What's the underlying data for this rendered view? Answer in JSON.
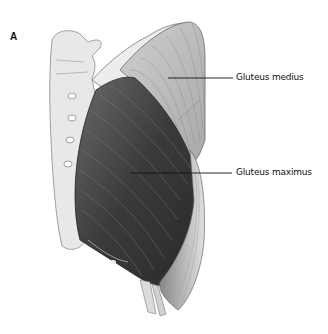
{
  "figure": {
    "panel_letter": "A",
    "labels": [
      {
        "text": "Gluteus medius",
        "leader": {
          "x1": 168,
          "y1": 78,
          "x2": 233,
          "y2": 78
        }
      },
      {
        "text": "Gluteus maximus",
        "leader": {
          "x1": 130,
          "y1": 173,
          "x2": 232,
          "y2": 173
        }
      }
    ],
    "structures": [
      "sacrum-and-lumbar-vertebrae",
      "iliac-crest",
      "gluteus-medius",
      "gluteus-maximus",
      "femur-tendons"
    ],
    "colors": {
      "background": "#ffffff",
      "bone": "#e8e8e6",
      "medius": "#bdbdbd",
      "maximus": "#3a3a3a",
      "line": "#111111"
    }
  }
}
